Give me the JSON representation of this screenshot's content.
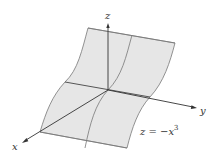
{
  "figure": {
    "surface_fill": "#e6e6e6",
    "edge_color": "#666666",
    "axis_color": "#333333",
    "axes": {
      "x_label": "x",
      "y_label": "y",
      "z_label": "z"
    },
    "equation": {
      "lhs": "z = −x",
      "exponent": "3"
    }
  }
}
